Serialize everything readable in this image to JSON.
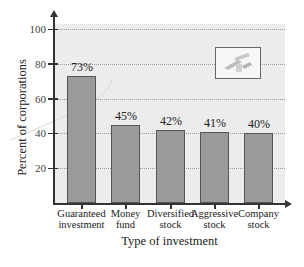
{
  "chart_data": {
    "type": "bar",
    "title": "",
    "xlabel": "Type of investment",
    "ylabel": "Percent of corporations",
    "categories": [
      "Guaranteed investment",
      "Money fund",
      "Diversified stock",
      "Aggressive stock",
      "Company stock"
    ],
    "category_lines": [
      [
        "Guaranteed",
        "investment"
      ],
      [
        "Money",
        "fund"
      ],
      [
        "Diversified",
        "stock"
      ],
      [
        "Aggressive",
        "stock"
      ],
      [
        "Company",
        "stock"
      ]
    ],
    "values": [
      73,
      45,
      42,
      41,
      40
    ],
    "data_labels": [
      "73%",
      "45%",
      "42%",
      "41%",
      "40%"
    ],
    "yticks": [
      "20",
      "40",
      "60",
      "80",
      "100"
    ],
    "ylim": [
      0,
      100
    ],
    "grid": true,
    "legend": null
  },
  "colors": {
    "bar": "#9a9a9a",
    "plot_background": "#ececec",
    "axis": "#333333"
  },
  "decoration": {
    "icon": "money-stack-icon"
  }
}
